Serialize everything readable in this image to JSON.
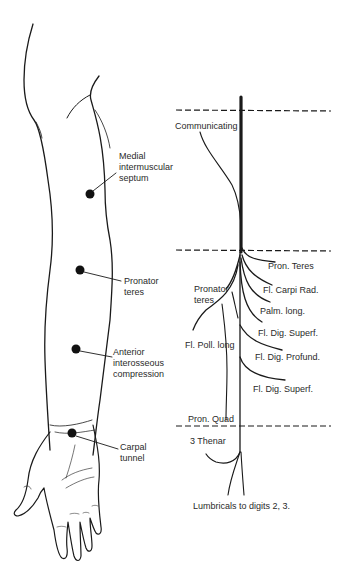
{
  "arm_labels": {
    "medial": [
      "Medial",
      "intermuscular",
      "septum"
    ],
    "pronator": [
      "Pronator",
      "teres"
    ],
    "anterior": [
      "Anterior",
      "interosseous",
      "compression"
    ],
    "carpal": [
      "Carpal",
      "tunnel"
    ]
  },
  "nerve_labels": {
    "communicating": "Communicating",
    "pron_teres": "Pron. Teres",
    "fl_carpi_rad": "Fl. Carpi Rad.",
    "palm_long": "Palm. long.",
    "fl_dig_superf_1": "Fl. Dig. Superf.",
    "fl_dig_profund": "Fl. Dig. Profund.",
    "fl_dig_superf_2": "Fl. Dig. Superf.",
    "pronator_teres_left": [
      "Pronator",
      "teres"
    ],
    "fl_poll_long": "Fl. Poll. long",
    "pron_quad": "Pron. Quad",
    "three_thenar": "3 Thenar",
    "lumbricals": "Lumbricals to digits 2, 3."
  }
}
